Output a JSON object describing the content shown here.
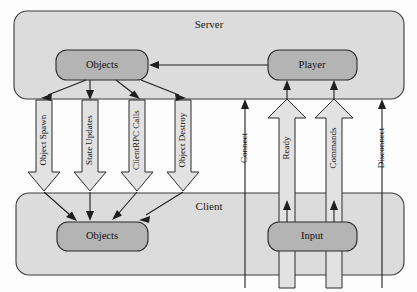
{
  "diagram": {
    "canvas": {
      "width": 417,
      "height": 292
    },
    "colors": {
      "background": "#fdfdfd",
      "container_fill": "#dcdcdc",
      "container_stroke": "#3b3b3b",
      "node_fill": "#b4b4b4",
      "node_stroke": "#2b2b2b",
      "hollow_arrow_fill": "#e2e2e2",
      "hollow_arrow_stroke": "#2b2b2b",
      "line_color": "#1f1f1f"
    },
    "containers": [
      {
        "id": "server",
        "label": "Server",
        "x": 14,
        "y": 11,
        "width": 390,
        "height": 88,
        "label_x": 209,
        "label_y": 25
      },
      {
        "id": "client",
        "label": "Client",
        "x": 16,
        "y": 193,
        "width": 388,
        "height": 82,
        "label_x": 209,
        "label_y": 207
      }
    ],
    "nodes": [
      {
        "id": "server-objects",
        "label": "Objects",
        "x": 56,
        "y": 50,
        "width": 92,
        "height": 30,
        "label_x": 102,
        "label_y": 65
      },
      {
        "id": "server-player",
        "label": "Player",
        "x": 268,
        "y": 50,
        "width": 89,
        "height": 30,
        "label_x": 312,
        "label_y": 65
      },
      {
        "id": "client-objects",
        "label": "Objects",
        "x": 57,
        "y": 222,
        "width": 91,
        "height": 29,
        "label_x": 102,
        "label_y": 236
      },
      {
        "id": "client-input",
        "label": "Input",
        "x": 268,
        "y": 222,
        "width": 89,
        "height": 29,
        "label_x": 312,
        "label_y": 236
      }
    ],
    "downstream_flows": [
      {
        "id": "object-spawn",
        "label": "Object Spawn",
        "center_x": 44,
        "shaft_half": 8,
        "head_half": 16,
        "top_y": 100,
        "head_top_y": 172,
        "tip_y": 191,
        "label_x": 44,
        "label_y": 140
      },
      {
        "id": "state-updates",
        "label": "State Updates",
        "center_x": 90,
        "shaft_half": 8,
        "head_half": 16,
        "top_y": 100,
        "head_top_y": 172,
        "tip_y": 191,
        "label_x": 90,
        "label_y": 140
      },
      {
        "id": "clientrpc-calls",
        "label": "ClientRPC Calls",
        "center_x": 137,
        "shaft_half": 8,
        "head_half": 16,
        "top_y": 100,
        "head_top_y": 172,
        "tip_y": 191,
        "label_x": 137,
        "label_y": 140
      },
      {
        "id": "object-destroy",
        "label": "Object Destroy",
        "center_x": 183,
        "shaft_half": 8,
        "head_half": 16,
        "top_y": 100,
        "head_top_y": 172,
        "tip_y": 191,
        "label_x": 183,
        "label_y": 140
      }
    ],
    "upstream_hollow_flows": [
      {
        "id": "ready",
        "label": "Ready",
        "center_x": 287,
        "shaft_half": 8,
        "head_half": 19,
        "bottom_y": 288,
        "head_bottom_y": 118,
        "tip_y": 99,
        "label_x": 287,
        "label_y": 145
      },
      {
        "id": "commands",
        "label": "Commands",
        "center_x": 334,
        "shaft_half": 8,
        "head_half": 19,
        "bottom_y": 288,
        "head_bottom_y": 118,
        "tip_y": 99,
        "label_x": 334,
        "label_y": 145
      }
    ],
    "upstream_thin_flows": [
      {
        "id": "connect",
        "label": "Connect",
        "x": 245,
        "bottom_y": 288,
        "tip_y": 99,
        "label_x": 245,
        "label_y": 145
      },
      {
        "id": "disconnect",
        "label": "Disconnect",
        "x": 382,
        "bottom_y": 288,
        "tip_y": 99,
        "label_x": 382,
        "label_y": 145
      }
    ],
    "connector_lines": [
      {
        "id": "player-to-objects",
        "from_node": "server-player",
        "to_node": "server-objects",
        "path": "M 268 65 L 152 65",
        "arrow_points": "150,65 158,61.5 158,68.5"
      },
      {
        "id": "server-objects-to-object-spawn",
        "from_node": "server-objects",
        "to_node": "object-spawn",
        "path": "M 85 80 L 45 97",
        "arrow_points": "42,98.5 50.5,97.5 47.5,91.5"
      },
      {
        "id": "server-objects-to-state-updates",
        "from_node": "server-objects",
        "to_node": "state-updates",
        "path": "M 90 80 L 90 96",
        "arrow_points": "90,100 86.5,92 93.5,92"
      },
      {
        "id": "server-objects-to-clientrpc",
        "from_node": "server-objects",
        "to_node": "clientrpc-calls",
        "path": "M 116 80 L 136 96",
        "arrow_points": "139,98.5 130.5,97 134.5,91"
      },
      {
        "id": "server-objects-to-object-destroy",
        "from_node": "server-objects",
        "to_node": "object-destroy",
        "path": "M 140 80 L 181 96",
        "arrow_points": "184,98 175.5,97.5 178,91.5"
      },
      {
        "id": "object-spawn-to-client-objects",
        "from_node": "object-spawn",
        "to_node": "client-objects",
        "path": "M 44 192 L 72 218",
        "arrow_points": "75,221 66,219 70.5,213.5"
      },
      {
        "id": "state-updates-to-client-objects",
        "from_node": "state-updates",
        "to_node": "client-objects",
        "path": "M 90 192 L 90 217",
        "arrow_points": "90,221 86.5,213 93.5,213"
      },
      {
        "id": "clientrpc-to-client-objects",
        "from_node": "clientrpc-calls",
        "to_node": "client-objects",
        "path": "M 137 192 L 116 217",
        "arrow_points": "113,220 121,218 117,212.5"
      },
      {
        "id": "object-destroy-to-client-objects",
        "from_node": "object-destroy",
        "to_node": "client-objects",
        "path": "M 183 192 L 143 217",
        "arrow_points": "140,219.5 148.5,218.5 145,212.5"
      },
      {
        "id": "client-input-to-ready",
        "from_node": "client-input",
        "to_node": "ready",
        "path": "M 287 222 L 287 207",
        "arrow_points": "287,203 283.5,211 290.5,211"
      },
      {
        "id": "client-input-to-commands",
        "from_node": "client-input",
        "to_node": "commands",
        "path": "M 334 222 L 334 207",
        "arrow_points": "334,203 330.5,211 337.5,211"
      },
      {
        "id": "ready-to-player",
        "from_node": "ready",
        "to_node": "server-player",
        "path": "M 287 99 L 287 86",
        "arrow_points": "287,81 283.5,89 290.5,89"
      },
      {
        "id": "commands-to-player",
        "from_node": "commands",
        "to_node": "server-player",
        "path": "M 334 99 L 334 86",
        "arrow_points": "334,81 330.5,89 337.5,89"
      }
    ]
  }
}
